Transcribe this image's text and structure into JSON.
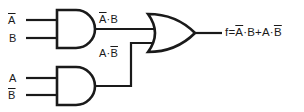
{
  "figure": {
    "ink_color": "#1a1a1a",
    "background_color": "#ffffff"
  },
  "inputs": [
    {
      "id": "a-bar",
      "label": "A",
      "overline": true,
      "gate": "and-top",
      "pin": "top"
    },
    {
      "id": "b",
      "label": "B",
      "overline": false,
      "gate": "and-top",
      "pin": "bottom"
    },
    {
      "id": "a",
      "label": "A",
      "overline": false,
      "gate": "and-bottom",
      "pin": "top"
    },
    {
      "id": "b-bar",
      "label": "B",
      "overline": true,
      "gate": "and-bottom",
      "pin": "bottom"
    }
  ],
  "gates": [
    {
      "id": "and-top",
      "type": "AND",
      "output_label_plain": "A·B"
    },
    {
      "id": "and-bottom",
      "type": "AND",
      "output_label_plain": "A·B"
    },
    {
      "id": "or-out",
      "type": "OR",
      "output_label_plain": "f=A·B+A·B"
    }
  ],
  "labels": {
    "and_top_output": {
      "parts": [
        {
          "text": "A",
          "overline": true
        },
        {
          "text": "·B",
          "overline": false
        }
      ]
    },
    "and_bottom_output": {
      "parts": [
        {
          "text": "A·",
          "overline": false
        },
        {
          "text": "B",
          "overline": true
        }
      ]
    },
    "or_output": {
      "parts": [
        {
          "text": "f=",
          "overline": false
        },
        {
          "text": "A",
          "overline": true
        },
        {
          "text": "·B+A·",
          "overline": false
        },
        {
          "text": "B",
          "overline": true
        }
      ]
    }
  },
  "expression": {
    "output_variable": "f",
    "text_plain": "f = A' · B + A · B'",
    "operator_and": "·",
    "operator_or": "+"
  }
}
